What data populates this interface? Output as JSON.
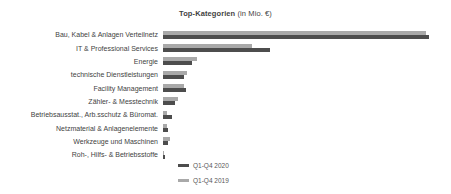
{
  "title": {
    "main": "Top-Kategorien",
    "suffix": " (in Mio. €)"
  },
  "chart_data": {
    "type": "bar",
    "orientation": "horizontal",
    "title": "Top-Kategorien (in Mio. €)",
    "value_axis_label": "in Mio. €",
    "value_axis_ticks_visible": false,
    "grid": false,
    "legend_position": "bottom-left-of-plot",
    "categories": [
      "Bau, Kabel & Anlagen Verteilnetz",
      "IT & Professional Services",
      "Energie",
      "technische Dienstleistungen",
      "Facility Management",
      "Zähler- & Messtechnik",
      "Betriebsausstat., Arb.sschutz & Büromat.",
      "Netzmaterial & Anlagenelemente",
      "Werkzeuge und Maschinen",
      "Roh-, Hilfs- & Betriebsstoffe"
    ],
    "series": [
      {
        "name": "Q1-Q4 2020",
        "color": "#4d4d4d",
        "note": "values unlabeled in chart; bar lengths measured in screenshot px",
        "lengths_px": [
          266,
          107,
          29,
          21,
          23,
          12,
          9,
          5,
          5,
          2
        ]
      },
      {
        "name": "Q1-Q4 2019",
        "color": "#a9a9a9",
        "note": "values unlabeled in chart; bar lengths measured in screenshot px",
        "lengths_px": [
          263,
          89,
          34,
          24,
          21,
          15,
          4,
          4,
          7,
          1
        ]
      }
    ],
    "layout": {
      "group_order_top_to_bottom": [
        "Q1-Q4 2019",
        "Q1-Q4 2020"
      ],
      "bar_start_x_px": 163,
      "bar_height_px": 4
    }
  },
  "legend": {
    "items": [
      {
        "label": "Q1-Q4 2020",
        "color": "#4d4d4d"
      },
      {
        "label": "Q1-Q4 2019",
        "color": "#a9a9a9"
      }
    ]
  }
}
